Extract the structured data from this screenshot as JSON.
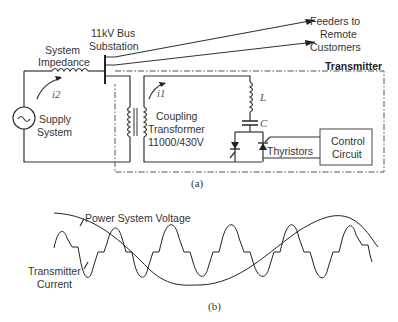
{
  "figure_a": {
    "caption": "(a)",
    "labels": {
      "bus_line1": "11kV Bus",
      "bus_line2": "Substation",
      "feeders_line1": "Feeders to",
      "feeders_line2": "Remote",
      "feeders_line3": "Customers",
      "transmitter": "Transmitter",
      "impedance_line1": "System",
      "impedance_line2": "Impedance",
      "supply_line1": "Supply",
      "supply_line2": "System",
      "coupling_line1": "Coupling",
      "coupling_line2": "Transformer",
      "coupling_line3": "11000/430V",
      "inductor": "L",
      "capacitor": "C",
      "thyristors": "Thyristors",
      "control_line1": "Control",
      "control_line2": "Circuit",
      "current_i1": "i1",
      "current_i2": "i2"
    }
  },
  "figure_b": {
    "caption": "(b)",
    "voltage_label": "Power System Voltage",
    "current_label_line1": "Transmitter",
    "current_label_line2": "Current"
  }
}
